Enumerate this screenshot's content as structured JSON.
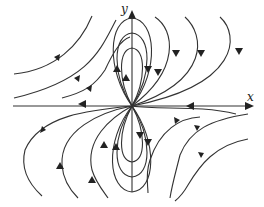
{
  "diagram": {
    "type": "phase-portrait",
    "axes": {
      "x_label": "x",
      "y_label": "y"
    },
    "colors": {
      "stroke": "#333333",
      "background": "#ffffff"
    }
  }
}
